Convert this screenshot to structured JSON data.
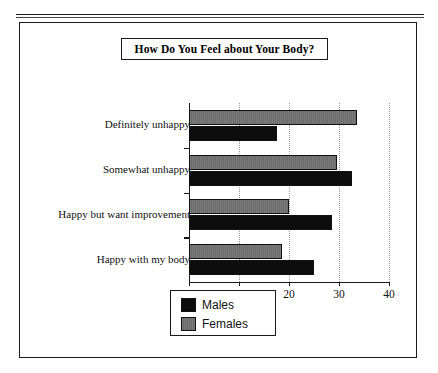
{
  "figure": {
    "has_top_rule": true,
    "frame_border_color": "#1a1a1a",
    "background": "#ffffff"
  },
  "chart_data": {
    "type": "bar",
    "orientation": "horizontal",
    "title": "How Do You Feel about Your Body?",
    "xlabel": "",
    "ylabel": "",
    "xlim": [
      0,
      40
    ],
    "xticks": [
      0,
      10,
      20,
      30,
      40
    ],
    "xtick_labels": [
      "0",
      "10",
      "20",
      "30",
      "40"
    ],
    "grid": "vertical-dotted",
    "legend_position": "bottom-center",
    "categories": [
      "Definitely unhappy",
      "Somewhat unhappy",
      "Happy but want improvement",
      "Happy with my body"
    ],
    "series": [
      {
        "name": "Males",
        "color": "#0d0d0d",
        "values": [
          17.5,
          32.5,
          28.5,
          25
        ]
      },
      {
        "name": "Females",
        "color": "#6f6f6f",
        "values": [
          33.5,
          29.5,
          20,
          18.5
        ]
      }
    ]
  },
  "legend": {
    "items": [
      {
        "label": "Males",
        "swatch": "black"
      },
      {
        "label": "Females",
        "swatch": "gray"
      }
    ]
  }
}
